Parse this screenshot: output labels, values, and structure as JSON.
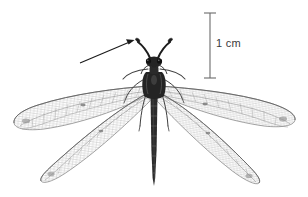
{
  "figure": {
    "background_color": "#ffffff",
    "ink_color": "#3a3a3a",
    "width": 308,
    "height": 197
  },
  "scale_bar": {
    "label": "1 cm",
    "orientation": "vertical",
    "x": 210,
    "top_y": 13,
    "bottom_y": 78,
    "color": "#6b6b6b"
  },
  "annotation_arrow": {
    "name": "antenna-pointer-arrow",
    "from_x": 80,
    "from_y": 63,
    "to_x": 134,
    "to_y": 40,
    "color": "#1f1f1f"
  },
  "specimen": {
    "common_name": "antlion",
    "body": {
      "head_x": 150,
      "head_y": 62,
      "thorax_y": 84,
      "abdomen_tip_y": 186
    },
    "antennae": {
      "count": 2,
      "type": "clubbed",
      "left_tip_x": 137,
      "left_tip_y": 40,
      "right_tip_x": 168,
      "right_tip_y": 40
    },
    "wings": [
      {
        "name": "left-forewing",
        "tip_x": 14,
        "tip_y": 122
      },
      {
        "name": "right-forewing",
        "tip_x": 295,
        "tip_y": 118
      },
      {
        "name": "left-hindwing",
        "tip_x": 40,
        "tip_y": 178
      },
      {
        "name": "right-hindwing",
        "tip_x": 256,
        "tip_y": 180
      }
    ],
    "legs": {
      "count": 6
    }
  }
}
